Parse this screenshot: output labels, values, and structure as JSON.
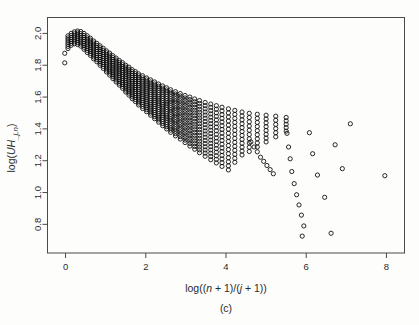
{
  "figure": {
    "caption": "(c)",
    "background": "#fdfdfc",
    "point_color": "#111111",
    "axis_color": "#4a4a4a"
  },
  "chart_data": {
    "type": "scatter",
    "title": "",
    "subtitle": "",
    "xlabel": "log((n + 1)/(j + 1))",
    "xlabel_parts": [
      "log((",
      "n",
      " + 1)/(",
      "j",
      " + 1))"
    ],
    "ylabel": "log(UH_j,n)",
    "ylabel_parts": [
      "log(",
      "UH",
      "_j,n",
      ")"
    ],
    "xlim": [
      -0.45,
      8.45
    ],
    "ylim": [
      0.62,
      2.1
    ],
    "xticks": [
      0,
      2,
      4,
      6,
      8
    ],
    "xticklabels": [
      "0",
      "2",
      "4",
      "6",
      "8"
    ],
    "yticks": [
      0.8,
      1.0,
      1.2,
      1.4,
      1.6,
      1.8,
      2.0
    ],
    "yticklabels": [
      "0.8",
      "1.0",
      "1.2",
      "1.4",
      "1.6",
      "1.8",
      "2.0"
    ],
    "grid": false,
    "legend": null,
    "marker": "open-circle",
    "marker_size": 2.1,
    "series": [
      {
        "name": "UH statistic",
        "comb_columns": [
          {
            "x": -0.02,
            "y_top": 1.875,
            "y_bottom": 1.815,
            "n": 2
          },
          {
            "x": 0.06,
            "y_top": 1.985,
            "y_bottom": 1.905,
            "n": 7
          },
          {
            "x": 0.14,
            "y_top": 2.0,
            "y_bottom": 1.925,
            "n": 7
          },
          {
            "x": 0.22,
            "y_top": 2.01,
            "y_bottom": 1.935,
            "n": 7
          },
          {
            "x": 0.3,
            "y_top": 2.015,
            "y_bottom": 1.93,
            "n": 8
          },
          {
            "x": 0.38,
            "y_top": 2.012,
            "y_bottom": 1.92,
            "n": 8
          },
          {
            "x": 0.46,
            "y_top": 2.0,
            "y_bottom": 1.9,
            "n": 9
          },
          {
            "x": 0.54,
            "y_top": 1.985,
            "y_bottom": 1.88,
            "n": 9
          },
          {
            "x": 0.62,
            "y_top": 1.97,
            "y_bottom": 1.862,
            "n": 10
          },
          {
            "x": 0.7,
            "y_top": 1.952,
            "y_bottom": 1.84,
            "n": 10
          },
          {
            "x": 0.78,
            "y_top": 1.938,
            "y_bottom": 1.822,
            "n": 10
          },
          {
            "x": 0.86,
            "y_top": 1.922,
            "y_bottom": 1.8,
            "n": 11
          },
          {
            "x": 0.94,
            "y_top": 1.906,
            "y_bottom": 1.78,
            "n": 11
          },
          {
            "x": 1.02,
            "y_top": 1.89,
            "y_bottom": 1.758,
            "n": 12
          },
          {
            "x": 1.1,
            "y_top": 1.876,
            "y_bottom": 1.738,
            "n": 12
          },
          {
            "x": 1.18,
            "y_top": 1.86,
            "y_bottom": 1.716,
            "n": 13
          },
          {
            "x": 1.26,
            "y_top": 1.845,
            "y_bottom": 1.695,
            "n": 13
          },
          {
            "x": 1.34,
            "y_top": 1.83,
            "y_bottom": 1.675,
            "n": 14
          },
          {
            "x": 1.42,
            "y_top": 1.816,
            "y_bottom": 1.655,
            "n": 14
          },
          {
            "x": 1.5,
            "y_top": 1.8,
            "y_bottom": 1.632,
            "n": 15
          },
          {
            "x": 1.58,
            "y_top": 1.788,
            "y_bottom": 1.612,
            "n": 15
          },
          {
            "x": 1.66,
            "y_top": 1.772,
            "y_bottom": 1.59,
            "n": 16
          },
          {
            "x": 1.74,
            "y_top": 1.76,
            "y_bottom": 1.572,
            "n": 16
          },
          {
            "x": 1.82,
            "y_top": 1.746,
            "y_bottom": 1.55,
            "n": 17
          },
          {
            "x": 1.92,
            "y_top": 1.734,
            "y_bottom": 1.528,
            "n": 17
          },
          {
            "x": 2.02,
            "y_top": 1.72,
            "y_bottom": 1.508,
            "n": 18
          },
          {
            "x": 2.12,
            "y_top": 1.708,
            "y_bottom": 1.486,
            "n": 18
          },
          {
            "x": 2.22,
            "y_top": 1.695,
            "y_bottom": 1.464,
            "n": 19
          },
          {
            "x": 2.32,
            "y_top": 1.682,
            "y_bottom": 1.442,
            "n": 19
          },
          {
            "x": 2.42,
            "y_top": 1.67,
            "y_bottom": 1.42,
            "n": 20
          },
          {
            "x": 2.52,
            "y_top": 1.658,
            "y_bottom": 1.4,
            "n": 20
          },
          {
            "x": 2.62,
            "y_top": 1.646,
            "y_bottom": 1.378,
            "n": 20
          },
          {
            "x": 2.74,
            "y_top": 1.634,
            "y_bottom": 1.356,
            "n": 20
          },
          {
            "x": 2.86,
            "y_top": 1.622,
            "y_bottom": 1.336,
            "n": 20
          },
          {
            "x": 2.98,
            "y_top": 1.61,
            "y_bottom": 1.314,
            "n": 20
          },
          {
            "x": 3.1,
            "y_top": 1.6,
            "y_bottom": 1.292,
            "n": 20
          },
          {
            "x": 3.22,
            "y_top": 1.588,
            "y_bottom": 1.272,
            "n": 19
          },
          {
            "x": 3.34,
            "y_top": 1.578,
            "y_bottom": 1.25,
            "n": 19
          },
          {
            "x": 3.48,
            "y_top": 1.566,
            "y_bottom": 1.228,
            "n": 18
          },
          {
            "x": 3.62,
            "y_top": 1.556,
            "y_bottom": 1.206,
            "n": 18
          },
          {
            "x": 3.76,
            "y_top": 1.546,
            "y_bottom": 1.186,
            "n": 17
          },
          {
            "x": 3.9,
            "y_top": 1.536,
            "y_bottom": 1.164,
            "n": 17
          },
          {
            "x": 4.06,
            "y_top": 1.526,
            "y_bottom": 1.142,
            "n": 16
          },
          {
            "x": 4.22,
            "y_top": 1.516,
            "y_bottom": 1.19,
            "n": 14
          },
          {
            "x": 4.4,
            "y_top": 1.506,
            "y_bottom": 1.236,
            "n": 12
          },
          {
            "x": 4.58,
            "y_top": 1.498,
            "y_bottom": 1.258,
            "n": 10
          },
          {
            "x": 4.78,
            "y_top": 1.492,
            "y_bottom": 1.286,
            "n": 9
          },
          {
            "x": 5.0,
            "y_top": 1.486,
            "y_bottom": 1.318,
            "n": 8
          },
          {
            "x": 5.24,
            "y_top": 1.48,
            "y_bottom": 1.35,
            "n": 6
          },
          {
            "x": 5.5,
            "y_top": 1.472,
            "y_bottom": 1.386,
            "n": 5
          }
        ],
        "sparse_points": [
          {
            "x": 4.62,
            "y": 1.318
          },
          {
            "x": 4.7,
            "y": 1.286
          },
          {
            "x": 4.78,
            "y": 1.256
          },
          {
            "x": 4.86,
            "y": 1.222
          },
          {
            "x": 4.94,
            "y": 1.196
          },
          {
            "x": 5.02,
            "y": 1.17
          },
          {
            "x": 5.1,
            "y": 1.144
          },
          {
            "x": 5.18,
            "y": 1.118
          },
          {
            "x": 5.52,
            "y": 1.372
          },
          {
            "x": 5.56,
            "y": 1.286
          },
          {
            "x": 5.6,
            "y": 1.212
          },
          {
            "x": 5.64,
            "y": 1.132
          },
          {
            "x": 5.7,
            "y": 1.056
          },
          {
            "x": 5.76,
            "y": 0.986
          },
          {
            "x": 5.82,
            "y": 0.922
          },
          {
            "x": 5.88,
            "y": 0.858
          },
          {
            "x": 5.94,
            "y": 0.79
          },
          {
            "x": 5.9,
            "y": 0.726
          },
          {
            "x": 6.08,
            "y": 1.376
          },
          {
            "x": 6.16,
            "y": 1.244
          },
          {
            "x": 6.28,
            "y": 1.11
          },
          {
            "x": 6.46,
            "y": 0.97
          },
          {
            "x": 6.62,
            "y": 0.744
          },
          {
            "x": 6.72,
            "y": 1.3
          },
          {
            "x": 6.9,
            "y": 1.15
          },
          {
            "x": 7.1,
            "y": 1.432
          },
          {
            "x": 7.96,
            "y": 1.106
          }
        ]
      }
    ]
  }
}
